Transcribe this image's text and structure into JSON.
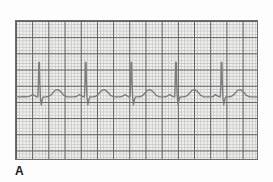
{
  "figure": {
    "panel_label": "A",
    "caption_alt": "ECG rhythm strip"
  },
  "strip": {
    "background_color": "#f0f0ef",
    "border_color": "#6f6f6f",
    "minor_grid_color": "#c9c9c7",
    "major_grid_color": "#5e5e5e",
    "trace_color": "#7d7d7d",
    "label_color": "#1a1a1a"
  },
  "chart_data": {
    "type": "line",
    "title": "A",
    "subtitle": "",
    "xlabel": "",
    "ylabel": "",
    "grid": true,
    "legend_position": "none",
    "xlim": [
      0,
      243
    ],
    "ylim": [
      0,
      140
    ],
    "paper": {
      "major_box_px": 16.2,
      "minor_per_major": 5,
      "major_cols": 15,
      "major_rows": 9,
      "baseline_y_px": 77
    },
    "rhythm": {
      "name": "Normal sinus rhythm",
      "beat_count": 5,
      "r_peak_x_px": [
        23,
        70,
        116,
        161,
        207
      ],
      "rr_interval_px": 46,
      "baseline_y_px": 77,
      "r_peak_y_px": 42,
      "r_amplitude_px": 35,
      "s_trough_y_px": 85,
      "t_wave_peak_y_px": 70,
      "p_wave_peak_y_px": 74
    },
    "series": [
      {
        "name": "ECG lead trace",
        "color": "#7d7d7d",
        "points": [
          [
            0,
            77
          ],
          [
            4,
            77
          ],
          [
            8,
            76.6
          ],
          [
            11,
            77
          ],
          [
            14,
            76.2
          ],
          [
            17,
            74.6
          ],
          [
            20,
            76.4
          ],
          [
            21,
            77
          ],
          [
            22,
            77
          ],
          [
            22.6,
            62
          ],
          [
            23,
            42
          ],
          [
            23.6,
            42
          ],
          [
            24,
            62
          ],
          [
            24.6,
            77
          ],
          [
            25.4,
            85
          ],
          [
            26.4,
            80
          ],
          [
            27.4,
            77
          ],
          [
            30,
            77
          ],
          [
            33,
            76.6
          ],
          [
            36,
            74.4
          ],
          [
            39,
            70.6
          ],
          [
            42,
            69.6
          ],
          [
            45,
            71.4
          ],
          [
            48,
            75.2
          ],
          [
            51,
            76.8
          ],
          [
            54,
            77
          ],
          [
            58,
            77
          ],
          [
            61,
            76.6
          ],
          [
            64,
            74.6
          ],
          [
            67,
            76.4
          ],
          [
            68,
            77
          ],
          [
            69,
            77
          ],
          [
            69.6,
            62
          ],
          [
            70,
            42
          ],
          [
            70.6,
            42
          ],
          [
            71,
            62
          ],
          [
            71.6,
            77
          ],
          [
            72.4,
            85
          ],
          [
            73.4,
            80
          ],
          [
            74.4,
            77
          ],
          [
            77,
            77
          ],
          [
            80,
            76.6
          ],
          [
            83,
            74.4
          ],
          [
            86,
            70.6
          ],
          [
            89,
            69.6
          ],
          [
            92,
            71.4
          ],
          [
            95,
            75.2
          ],
          [
            98,
            76.8
          ],
          [
            101,
            77
          ],
          [
            104,
            77
          ],
          [
            107,
            76.6
          ],
          [
            110,
            74.6
          ],
          [
            113,
            76.4
          ],
          [
            114,
            77
          ],
          [
            115,
            77
          ],
          [
            115.6,
            62
          ],
          [
            116,
            42
          ],
          [
            116.6,
            42
          ],
          [
            117,
            62
          ],
          [
            117.6,
            77
          ],
          [
            118.4,
            85
          ],
          [
            119.4,
            80
          ],
          [
            120.4,
            77
          ],
          [
            123,
            77
          ],
          [
            126,
            76.6
          ],
          [
            129,
            74.4
          ],
          [
            132,
            70.6
          ],
          [
            135,
            69.6
          ],
          [
            138,
            71.4
          ],
          [
            141,
            75.2
          ],
          [
            144,
            76.8
          ],
          [
            147,
            77
          ],
          [
            150,
            77
          ],
          [
            152,
            76.6
          ],
          [
            155,
            74.6
          ],
          [
            158,
            76.4
          ],
          [
            159,
            77
          ],
          [
            160,
            77
          ],
          [
            160.6,
            62
          ],
          [
            161,
            42
          ],
          [
            161.6,
            42
          ],
          [
            162,
            62
          ],
          [
            162.6,
            77
          ],
          [
            163.4,
            85
          ],
          [
            164.4,
            80
          ],
          [
            165.4,
            77
          ],
          [
            168,
            77
          ],
          [
            171,
            76.6
          ],
          [
            174,
            74.4
          ],
          [
            177,
            70.6
          ],
          [
            180,
            69.6
          ],
          [
            183,
            71.4
          ],
          [
            186,
            75.2
          ],
          [
            189,
            76.8
          ],
          [
            192,
            77
          ],
          [
            196,
            77
          ],
          [
            199,
            76.6
          ],
          [
            201,
            74.6
          ],
          [
            204,
            76.4
          ],
          [
            205,
            77
          ],
          [
            206,
            77
          ],
          [
            206.6,
            62
          ],
          [
            207,
            42
          ],
          [
            207.6,
            42
          ],
          [
            208,
            62
          ],
          [
            208.6,
            77
          ],
          [
            209.4,
            85
          ],
          [
            210.4,
            80
          ],
          [
            211.4,
            77
          ],
          [
            214,
            77
          ],
          [
            217,
            76.6
          ],
          [
            220,
            74.4
          ],
          [
            223,
            70.6
          ],
          [
            226,
            69.6
          ],
          [
            229,
            71.4
          ],
          [
            232,
            75.2
          ],
          [
            235,
            76.8
          ],
          [
            238,
            77
          ],
          [
            243,
            77
          ]
        ]
      }
    ]
  }
}
